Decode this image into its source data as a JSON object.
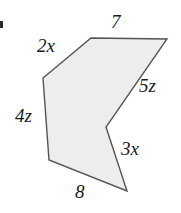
{
  "figure": {
    "kind": "polygon-diagram",
    "background_color": "#ffffff",
    "fill_color": "#ededed",
    "stroke_color": "#555555",
    "stroke_width": 1.4,
    "canvas": {
      "width": 181,
      "height": 213
    },
    "vertices": [
      {
        "name": "top-left",
        "x": 91,
        "y": 38
      },
      {
        "name": "top-right",
        "x": 167,
        "y": 39
      },
      {
        "name": "notch",
        "x": 106,
        "y": 127
      },
      {
        "name": "bottom-point",
        "x": 127,
        "y": 191
      },
      {
        "name": "bottom-left",
        "x": 49,
        "y": 160
      },
      {
        "name": "upper-left",
        "x": 43,
        "y": 78
      }
    ],
    "labels": {
      "top": "7",
      "upper_left": "2x",
      "left": "4z",
      "right": "5z",
      "lower_right": "3x",
      "bottom": "8"
    }
  }
}
